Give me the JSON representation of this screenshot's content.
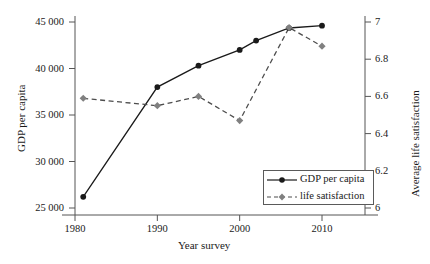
{
  "chart_data": {
    "type": "line",
    "title": "",
    "xlabel": "Year survey",
    "ylabel": "GDP per capita",
    "y2label": "Average life satisfaction",
    "xlim": [
      1978.5,
      2012.5
    ],
    "ylim": [
      24000,
      46000
    ],
    "y2lim": [
      5.9,
      7.05
    ],
    "grid": false,
    "legend_position": "bottom-right",
    "x_ticks": [
      "1980",
      "1990",
      "2000",
      "2010"
    ],
    "x_tick_values": [
      1980,
      1990,
      2000,
      2010
    ],
    "y_ticks": [
      "25 000",
      "30 000",
      "35 000",
      "40 000",
      "45 000"
    ],
    "y_tick_values": [
      25000,
      30000,
      35000,
      40000,
      45000
    ],
    "y2_ticks": [
      "6",
      "6.2",
      "6.4",
      "6.6",
      "6.8",
      "7"
    ],
    "y2_tick_values": [
      6,
      6.2,
      6.4,
      6.6,
      6.8,
      7
    ],
    "series": [
      {
        "name": "GDP per capita",
        "axis": "left",
        "color": "#1a1a1a",
        "line_style": "solid",
        "marker": "circle",
        "marker_color": "#1a1a1a",
        "x": [
          1981,
          1990,
          1995,
          2000,
          2002,
          2006,
          2010
        ],
        "values": [
          26200,
          38000,
          40300,
          42000,
          43000,
          44350,
          44600
        ]
      },
      {
        "name": "life satisfaction",
        "axis": "right",
        "color": "#4d4d4d",
        "line_style": "dashed",
        "marker": "diamond",
        "marker_color": "#808080",
        "x": [
          1981,
          1990,
          1995,
          2000,
          2006,
          2010
        ],
        "values": [
          6.59,
          6.55,
          6.6,
          6.47,
          6.97,
          6.87
        ]
      }
    ]
  },
  "legend": {
    "items": [
      {
        "label": "GDP per capita"
      },
      {
        "label": "life satisfaction"
      }
    ]
  },
  "axes": {
    "x_title": "Year survey",
    "y_left_title": "GDP per capita",
    "y_right_title": "Average life satisfaction"
  }
}
